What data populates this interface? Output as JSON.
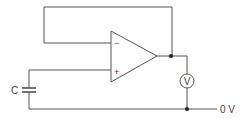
{
  "diagram": {
    "type": "circuit",
    "title": "",
    "components": {
      "opamp": {
        "inverting_symbol": "−",
        "noninverting_symbol": "+"
      },
      "capacitor": {
        "label": "C"
      },
      "voltmeter": {
        "label": "V"
      },
      "ground_rail": {
        "label": "0 V"
      }
    },
    "colors": {
      "line": "#555555",
      "background": "#ffffff"
    }
  }
}
